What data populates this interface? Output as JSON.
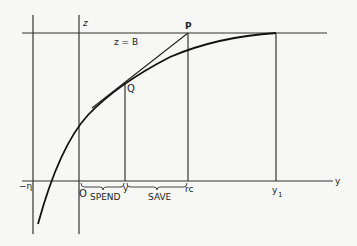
{
  "diagram": {
    "labels": {
      "z_axis": "z",
      "z_eq_B": "z = B",
      "P": "P",
      "Q": "Q",
      "neg_eta": "−η",
      "origin": "O",
      "y_small": "y",
      "rc": "rc",
      "y1": "y",
      "y1_sub": "1",
      "y_axis": "y",
      "spend": "SPEND",
      "save": "SAVE"
    },
    "colors": {
      "ink": "#222222",
      "background": "#f7f7f5"
    }
  }
}
